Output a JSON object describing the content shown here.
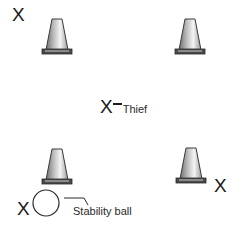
{
  "diagram": {
    "type": "drill-layout",
    "elements": {
      "cones": [
        {
          "id": "cone-top-left",
          "position": "top-left"
        },
        {
          "id": "cone-top-right",
          "position": "top-right"
        },
        {
          "id": "cone-bottom-left",
          "position": "bottom-left"
        },
        {
          "id": "cone-bottom-right",
          "position": "bottom-right"
        }
      ],
      "players": [
        {
          "id": "player-top-left",
          "symbol": "X"
        },
        {
          "id": "player-bottom-right",
          "symbol": "X"
        },
        {
          "id": "player-bottom-left",
          "symbol": "X"
        }
      ],
      "thief": {
        "symbol": "X",
        "label": "Thief"
      },
      "ball": {
        "label": "Stability ball"
      }
    },
    "colors": {
      "ink": "#1a1a1a",
      "cone_light": "#f2f2f2",
      "cone_dark": "#7a7a7a",
      "cone_base": "#4a4a4a"
    }
  }
}
